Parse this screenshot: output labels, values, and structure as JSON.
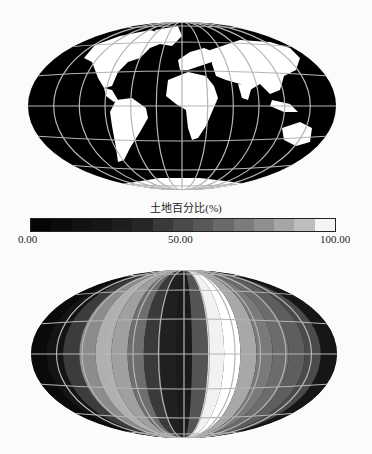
{
  "colorbar": {
    "title": "土地百分比(%)",
    "min_label": "0.00",
    "mid_label": "50.00",
    "max_label": "100.00",
    "colors": [
      "#050505",
      "#0b0b0b",
      "#111111",
      "#161616",
      "#1d1d1d",
      "#262626",
      "#3a3a3a",
      "#4a4a4a",
      "#585858",
      "#6a6a6a",
      "#7c7c7c",
      "#8f8f8f",
      "#a6a6a6",
      "#bdbdbd",
      "#f4f4f4"
    ]
  },
  "maps": {
    "top": {
      "name": "land-mask-map",
      "projection": "Hammer/Aitoff (elliptical)",
      "ocean_color": "#000000",
      "land_color": "#ffffff",
      "graticule_color": "#b5b5b5"
    },
    "bottom": {
      "name": "land-percentage-by-longitude-map",
      "graticule_color": "#b5b5b5",
      "bands": [
        {
          "color": "#0a0a0a"
        },
        {
          "color": "#141414"
        },
        {
          "color": "#3c3c3c"
        },
        {
          "color": "#8c8c8c"
        },
        {
          "color": "#b0b0b0"
        },
        {
          "color": "#a0a0a0"
        },
        {
          "color": "#6e6e6e"
        },
        {
          "color": "#3a3a3a"
        },
        {
          "color": "#202020"
        },
        {
          "color": "#1a1a1a"
        },
        {
          "color": "#555555"
        },
        {
          "color": "#f2f2f2"
        },
        {
          "color": "#ffffff"
        },
        {
          "color": "#a8a8a8"
        },
        {
          "color": "#7a7a7a"
        },
        {
          "color": "#6c6c6c"
        },
        {
          "color": "#5e5e5e"
        },
        {
          "color": "#4a4a4a"
        },
        {
          "color": "#161616"
        }
      ]
    }
  }
}
